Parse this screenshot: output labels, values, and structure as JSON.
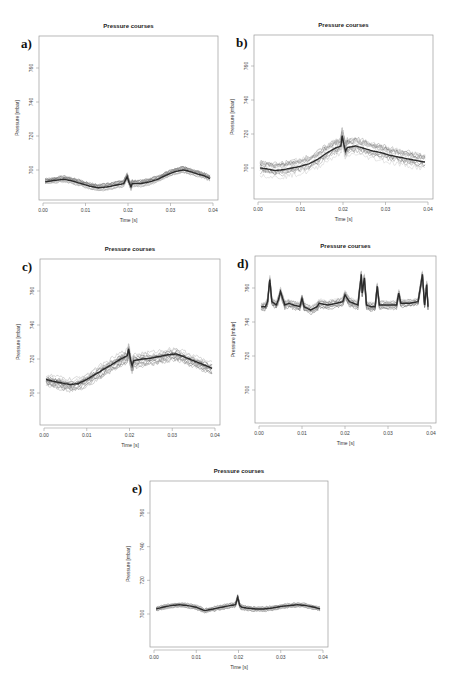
{
  "figure": {
    "panels": [
      {
        "id": "a",
        "label": "a)",
        "title": "Pressure courses",
        "xlabel": "Time [s]",
        "ylabel": "Pressure [mbar]",
        "box": {
          "left": 39,
          "top": 36,
          "right": 218,
          "bottom": 200
        },
        "yTickPx": {
          "760": 68,
          "700": 170
        }
      },
      {
        "id": "b",
        "label": "b)",
        "title": "Pressure courses",
        "xlabel": "Time [s]",
        "ylabel": "Pressure [mbar]",
        "box": {
          "left": 254,
          "top": 35,
          "right": 433,
          "bottom": 199
        },
        "yTickPx": {
          "760": 66,
          "700": 168
        }
      },
      {
        "id": "c",
        "label": "c)",
        "title": "Pressure courses",
        "xlabel": "Time [s]",
        "ylabel": "Pressure [mbar]",
        "box": {
          "left": 40,
          "top": 259,
          "right": 220,
          "bottom": 425
        },
        "yTickPx": {
          "760": 291,
          "700": 393
        }
      },
      {
        "id": "d",
        "label": "d)",
        "title": "Pressure courses",
        "xlabel": "Time [s]",
        "ylabel": "Pressure [mbar]",
        "box": {
          "left": 255,
          "top": 256,
          "right": 436,
          "bottom": 423
        },
        "yTickPx": {
          "760": 288,
          "700": 390
        }
      },
      {
        "id": "e",
        "label": "e)",
        "title": "Pressure courses",
        "xlabel": "Time [s]",
        "ylabel": "Pressure [mbar]",
        "box": {
          "left": 150,
          "top": 481,
          "right": 328,
          "bottom": 647
        },
        "yTickPx": {
          "760": 513,
          "700": 614
        }
      }
    ]
  },
  "chart_data": [
    {
      "panel": "a",
      "type": "line",
      "title": "Pressure courses",
      "xlabel": "Time [s]",
      "ylabel": "Pressure [mbar]",
      "xticks": [
        "0.00",
        "0.01",
        "0.02",
        "0.03",
        "0.04"
      ],
      "yticks": [
        "700",
        "720",
        "740",
        "760"
      ],
      "xlim": [
        0.0,
        0.04
      ],
      "ylim": [
        685,
        775
      ],
      "grid": false,
      "legend": null,
      "series": [
        {
          "name": "mean course (overlaid repetitions)",
          "x": [
            0.0005,
            0.003,
            0.005,
            0.007,
            0.009,
            0.011,
            0.013,
            0.015,
            0.017,
            0.019,
            0.0198,
            0.0202,
            0.0207,
            0.021,
            0.023,
            0.025,
            0.027,
            0.029,
            0.031,
            0.033,
            0.034,
            0.036,
            0.038,
            0.0393
          ],
          "y": [
            693,
            694,
            694.5,
            693.5,
            692,
            690.5,
            689.5,
            690,
            691,
            692,
            696,
            693,
            690,
            692,
            692,
            693,
            694.5,
            697,
            699,
            700,
            699.5,
            698,
            696.5,
            695
          ]
        }
      ],
      "spread": 2.5
    },
    {
      "panel": "b",
      "type": "line",
      "title": "Pressure courses",
      "xlabel": "Time [s]",
      "ylabel": "Pressure [mbar]",
      "xticks": [
        "0.00",
        "0.01",
        "0.02",
        "0.03",
        "0.04"
      ],
      "yticks": [
        "700",
        "720",
        "740",
        "760"
      ],
      "xlim": [
        0.0,
        0.04
      ],
      "ylim": [
        685,
        775
      ],
      "grid": false,
      "legend": null,
      "series": [
        {
          "name": "mean course (overlaid repetitions)",
          "x": [
            0.0005,
            0.002,
            0.004,
            0.006,
            0.008,
            0.01,
            0.012,
            0.014,
            0.016,
            0.018,
            0.0195,
            0.0198,
            0.0202,
            0.0206,
            0.021,
            0.023,
            0.025,
            0.027,
            0.029,
            0.031,
            0.033,
            0.035,
            0.037,
            0.0393
          ],
          "y": [
            700,
            699.5,
            698.5,
            699,
            700,
            701,
            702.5,
            705,
            708.5,
            711.5,
            713,
            719,
            714,
            710,
            712,
            713,
            711.5,
            710,
            709,
            707.5,
            706.5,
            705.5,
            704.5,
            703.5
          ]
        }
      ],
      "spread": 6
    },
    {
      "panel": "c",
      "type": "line",
      "title": "Pressure courses",
      "xlabel": "Time [s]",
      "ylabel": "Pressure [mbar]",
      "xticks": [
        "0.00",
        "0.01",
        "0.02",
        "0.03",
        "0.04"
      ],
      "yticks": [
        "700",
        "720",
        "740",
        "760"
      ],
      "xlim": [
        0.0,
        0.04
      ],
      "ylim": [
        685,
        775
      ],
      "grid": false,
      "legend": null,
      "series": [
        {
          "name": "mean course (overlaid repetitions)",
          "x": [
            0.0005,
            0.002,
            0.004,
            0.006,
            0.008,
            0.01,
            0.012,
            0.014,
            0.016,
            0.018,
            0.0195,
            0.0198,
            0.0202,
            0.0206,
            0.021,
            0.023,
            0.025,
            0.027,
            0.029,
            0.031,
            0.033,
            0.035,
            0.037,
            0.0393
          ],
          "y": [
            708,
            707,
            706,
            705,
            705.5,
            708,
            711,
            714,
            717,
            720,
            722,
            726,
            720,
            716,
            719,
            720,
            720.5,
            721.5,
            722.5,
            723,
            721,
            719,
            717,
            714.5
          ]
        }
      ],
      "spread": 5
    },
    {
      "panel": "d",
      "type": "line",
      "title": "Pressure courses",
      "xlabel": "Time [s]",
      "ylabel": "Pressure [mbar]",
      "xticks": [
        "0.00",
        "0.01",
        "0.02",
        "0.03",
        "0.04"
      ],
      "yticks": [
        "700",
        "720",
        "740",
        "760"
      ],
      "xlim": [
        0.0,
        0.04
      ],
      "ylim": [
        685,
        775
      ],
      "grid": false,
      "legend": null,
      "series": [
        {
          "name": "mean course (overlaid repetitions)",
          "x": [
            0.0005,
            0.0015,
            0.002,
            0.0025,
            0.003,
            0.004,
            0.0045,
            0.005,
            0.006,
            0.007,
            0.008,
            0.0095,
            0.01,
            0.0105,
            0.012,
            0.0135,
            0.014,
            0.016,
            0.018,
            0.0195,
            0.02,
            0.021,
            0.022,
            0.023,
            0.0238,
            0.024,
            0.0245,
            0.025,
            0.026,
            0.027,
            0.0275,
            0.028,
            0.03,
            0.032,
            0.0325,
            0.033,
            0.035,
            0.037,
            0.038,
            0.0385,
            0.039,
            0.0393
          ],
          "y": [
            749,
            749,
            752,
            765,
            752,
            750,
            753,
            758,
            750,
            751,
            750,
            749,
            754,
            749,
            747,
            749,
            751,
            750,
            751,
            752,
            756,
            752,
            751,
            750,
            768,
            757,
            766,
            750,
            749,
            749,
            761,
            750,
            750,
            750,
            757,
            751,
            751,
            752,
            768,
            750,
            762,
            749
          ]
        }
      ],
      "spread": 3
    },
    {
      "panel": "e",
      "type": "line",
      "title": "Pressure courses",
      "xlabel": "Time [s]",
      "ylabel": "Pressure [mbar]",
      "xticks": [
        "0.00",
        "0.01",
        "0.02",
        "0.03",
        "0.04"
      ],
      "yticks": [
        "700",
        "720",
        "740",
        "760"
      ],
      "xlim": [
        0.0,
        0.04
      ],
      "ylim": [
        685,
        775
      ],
      "grid": false,
      "legend": null,
      "series": [
        {
          "name": "mean course (overlaid repetitions)",
          "x": [
            0.0005,
            0.002,
            0.004,
            0.006,
            0.008,
            0.01,
            0.012,
            0.014,
            0.016,
            0.018,
            0.0193,
            0.0198,
            0.0203,
            0.0208,
            0.022,
            0.024,
            0.026,
            0.028,
            0.03,
            0.032,
            0.034,
            0.036,
            0.038,
            0.0393
          ],
          "y": [
            703,
            704,
            705,
            705.5,
            705,
            704,
            702,
            703,
            704,
            705,
            705.5,
            710,
            705,
            704,
            703.5,
            703,
            703,
            703.5,
            704.5,
            705,
            705.5,
            705,
            704,
            703
          ]
        }
      ],
      "spread": 1.8
    }
  ]
}
